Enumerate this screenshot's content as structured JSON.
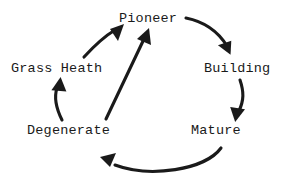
{
  "diagram": {
    "background_color": "#ffffff",
    "stroke_color": "#1a1a1a",
    "nodes": [
      {
        "id": "pioneer",
        "label": "Pioneer",
        "x": 150,
        "y": 19
      },
      {
        "id": "grass",
        "label": "Grass Heath",
        "x": 62,
        "y": 69
      },
      {
        "id": "building",
        "label": "Building",
        "x": 245,
        "y": 69
      },
      {
        "id": "degenerate",
        "label": "Degenerate",
        "x": 79,
        "y": 131
      },
      {
        "id": "mature",
        "label": "Mature",
        "x": 222,
        "y": 131
      }
    ],
    "edges": [
      {
        "id": "pioneer-to-building",
        "from": "pioneer",
        "to": "building",
        "style": "curved"
      },
      {
        "id": "building-to-mature",
        "from": "building",
        "to": "mature",
        "style": "curved"
      },
      {
        "id": "mature-to-degenerate",
        "from": "mature",
        "to": "degenerate",
        "style": "arc"
      },
      {
        "id": "degenerate-to-grass",
        "from": "degenerate",
        "to": "grass",
        "style": "curved"
      },
      {
        "id": "grass-to-pioneer",
        "from": "grass",
        "to": "pioneer",
        "style": "curved"
      },
      {
        "id": "degenerate-to-pioneer",
        "from": "degenerate",
        "to": "pioneer",
        "style": "straight"
      }
    ]
  }
}
